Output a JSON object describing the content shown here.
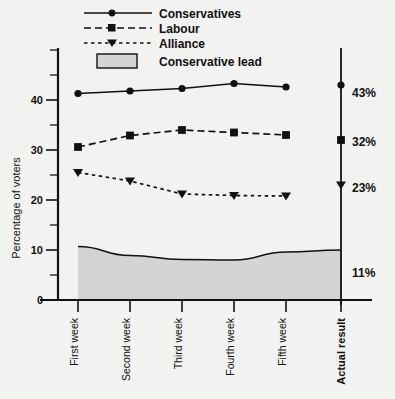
{
  "chart_data": {
    "type": "line",
    "title": "",
    "xlabel": "",
    "ylabel": "Percentage of voters",
    "ylim": [
      0,
      48
    ],
    "yticks_major": [
      0,
      10,
      20,
      30,
      40
    ],
    "yticks_minor": [
      5,
      15,
      25,
      35,
      45
    ],
    "grid": false,
    "legend_position": "top-center",
    "categories": [
      "First week",
      "Second week",
      "Third week",
      "Fourth week",
      "Fifth week",
      "Actual result"
    ],
    "series": [
      {
        "name": "Conservatives",
        "marker": "circle",
        "line": "solid",
        "values": [
          41.3,
          41.8,
          42.3,
          43.3,
          42.6,
          43
        ],
        "final_label": "43%"
      },
      {
        "name": "Labour",
        "marker": "square",
        "line": "dashed",
        "values": [
          30.6,
          32.9,
          34.0,
          33.5,
          33.0,
          32
        ],
        "final_label": "32%"
      },
      {
        "name": "Alliance",
        "marker": "triangle-down",
        "line": "dotted",
        "values": [
          25.5,
          23.8,
          21.2,
          20.9,
          20.8,
          23
        ],
        "final_label": "23%"
      },
      {
        "name": "Conservative lead",
        "marker": "none",
        "line": "area",
        "values": [
          10.7,
          8.9,
          8.1,
          8.0,
          9.6,
          10.0
        ],
        "final_label": "11%"
      }
    ]
  },
  "legend": {
    "items": [
      {
        "label": "Conservatives",
        "key": "conservatives"
      },
      {
        "label": "Labour",
        "key": "labour"
      },
      {
        "label": "Alliance",
        "key": "alliance"
      },
      {
        "label": "Conservative lead",
        "key": "conservative-lead"
      }
    ]
  },
  "axis": {
    "y_title": "Percentage of voters",
    "y_tick_labels": [
      "0",
      "10",
      "20",
      "30",
      "40"
    ],
    "x_tick_labels": [
      "First week",
      "Second week",
      "Third week",
      "Fourth week",
      "Fifth week",
      "Actual result"
    ]
  },
  "annotations": {
    "cons_result": "43%",
    "labour_result": "32%",
    "alliance_result": "23%",
    "lead_result": "11%"
  },
  "colors": {
    "ink": "#111111",
    "background": "#f2f2f0",
    "lead_fill": "#d4d4d2"
  }
}
